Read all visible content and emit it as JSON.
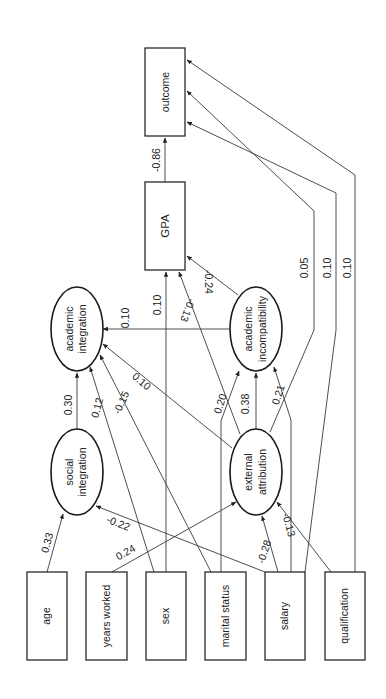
{
  "diagram": {
    "type": "path-diagram",
    "orientation": "rotated-90-ccw",
    "nodes": {
      "outcome": {
        "label": "outcome",
        "shape": "rect"
      },
      "gpa": {
        "label": "GPA",
        "shape": "rect"
      },
      "academic_integration": {
        "label_line1": "academic",
        "label_line2": "integration",
        "shape": "ellipse"
      },
      "academic_incompatibility": {
        "label_line1": "academic",
        "label_line2": "incompatibility",
        "shape": "ellipse"
      },
      "social_integration": {
        "label_line1": "social",
        "label_line2": "integration",
        "shape": "ellipse"
      },
      "external_attribution": {
        "label_line1": "external",
        "label_line2": "attribution",
        "shape": "ellipse"
      },
      "age": {
        "label": "age",
        "shape": "rect"
      },
      "years_worked": {
        "label": "years worked",
        "shape": "rect"
      },
      "sex": {
        "label": "sex",
        "shape": "rect"
      },
      "marital_status": {
        "label": "marital status",
        "shape": "rect"
      },
      "salary": {
        "label": "salary",
        "shape": "rect"
      },
      "qualification": {
        "label": "qualification",
        "shape": "rect"
      }
    },
    "edges": {
      "gpa_outcome": {
        "from": "GPA",
        "to": "outcome",
        "coef": "-0.86"
      },
      "extattr_outcome": {
        "from": "external attribution",
        "to": "outcome",
        "coef": "0.05"
      },
      "salary_outcome": {
        "from": "salary",
        "to": "outcome",
        "coef": "0.10"
      },
      "qual_outcome": {
        "from": "qualification",
        "to": "outcome",
        "coef": "0.10"
      },
      "acinc_gpa": {
        "from": "academic incompatibility",
        "to": "GPA",
        "coef": "-0.24"
      },
      "sex_gpa": {
        "from": "sex",
        "to": "GPA",
        "coef": "0.10"
      },
      "extattr_gpa": {
        "from": "external attribution",
        "to": "GPA",
        "coef": "-0.13"
      },
      "acinc_acint": {
        "from": "academic incompatibility",
        "to": "academic integration",
        "coef": "0.10"
      },
      "socint_acint": {
        "from": "social integration",
        "to": "academic integration",
        "coef": "0.30"
      },
      "yw_acint": {
        "from": "years worked",
        "to": "academic integration",
        "coef": "0.12"
      },
      "ms_acint": {
        "from": "marital status",
        "to": "academic integration",
        "coef": "-0.15"
      },
      "extattr_acint": {
        "from": "external attribution",
        "to": "academic integration",
        "coef": "0.10"
      },
      "ms_acinc": {
        "from": "marital status",
        "to": "academic incompatibility",
        "coef": "0.20"
      },
      "extattr_acinc": {
        "from": "external attribution",
        "to": "academic incompatibility",
        "coef": "0.38"
      },
      "salary_acinc": {
        "from": "salary",
        "to": "academic incompatibility",
        "coef": "0.21"
      },
      "age_socint": {
        "from": "age",
        "to": "social integration",
        "coef": "0.33"
      },
      "salary_socint": {
        "from": "salary",
        "to": "social integration",
        "coef": "-0.22"
      },
      "yw_extattr": {
        "from": "years worked",
        "to": "external attribution",
        "coef": "0.24"
      },
      "salary_extattr": {
        "from": "salary",
        "to": "external attribution",
        "coef": "-0.28"
      },
      "qual_extattr": {
        "from": "qualification",
        "to": "external attribution",
        "coef": "-0.13"
      }
    },
    "colors": {
      "stroke": "#2a2a2a",
      "text": "#222222",
      "background": "#ffffff"
    }
  }
}
